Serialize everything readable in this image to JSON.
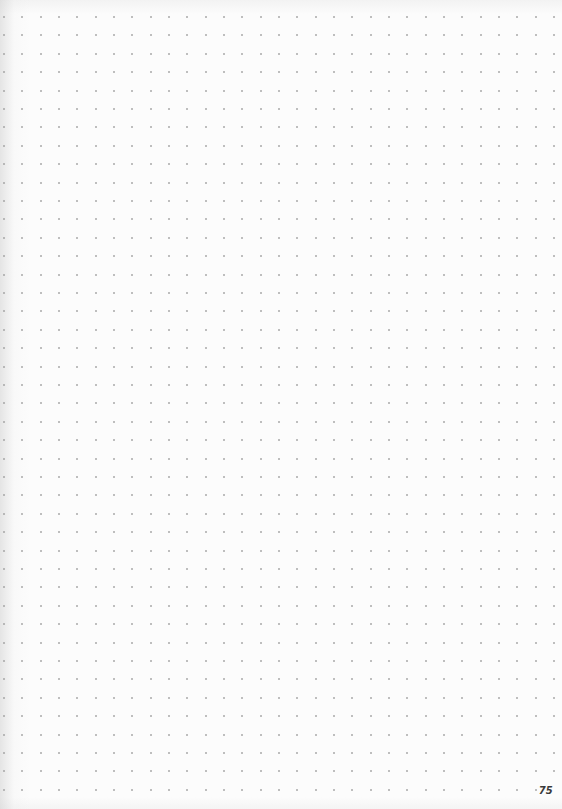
{
  "page": {
    "type": "dot-grid notebook page",
    "page_number": "75",
    "background_color": "#fcfcfc",
    "dot_color": "#9a9a9a",
    "page_number_color": "#3a3a3a"
  },
  "grid": {
    "columns": 31,
    "rows": 43,
    "origin_x": 4,
    "origin_y": 17,
    "spacing_x": 18.33,
    "spacing_y": 18.4,
    "omit_last_dot_for_page_number": true
  }
}
